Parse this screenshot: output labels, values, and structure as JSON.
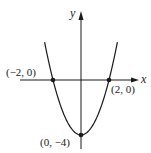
{
  "chart_data": {
    "type": "line",
    "title": "",
    "function": "y = x^2 - 4",
    "xlabel": "x",
    "ylabel": "y",
    "grid": false,
    "legend": null,
    "xlim": [
      -4.3,
      4.1
    ],
    "ylim": [
      -4.9,
      4.9
    ],
    "series": [
      {
        "name": "parabola",
        "x": [
          -2.6,
          -2.4,
          -2.2,
          -2.0,
          -1.6,
          -1.2,
          -0.8,
          -0.4,
          0.0,
          0.4,
          0.8,
          1.2,
          1.6,
          2.0,
          2.2,
          2.4,
          2.6
        ],
        "y": [
          2.76,
          1.76,
          0.84,
          0.0,
          -1.44,
          -2.56,
          -3.36,
          -3.84,
          -4.0,
          -3.84,
          -3.36,
          -2.56,
          -1.44,
          0.0,
          0.84,
          1.76,
          2.76
        ]
      }
    ],
    "points": [
      {
        "x": -2,
        "y": 0,
        "label": "(−2, 0)"
      },
      {
        "x": 2,
        "y": 0,
        "label": "(2, 0)"
      },
      {
        "x": 0,
        "y": -4,
        "label": "(0, −4)"
      }
    ],
    "annotations": [
      "(−2, 0)",
      "(2, 0)",
      "(0, −4)"
    ]
  },
  "labels": {
    "x_axis": "x",
    "y_axis": "y",
    "point_left": "(−2, 0)",
    "point_right": "(2, 0)",
    "point_vertex": "(0, −4)"
  },
  "colors": {
    "ink": "#1a1a1a",
    "background": "#ffffff"
  }
}
